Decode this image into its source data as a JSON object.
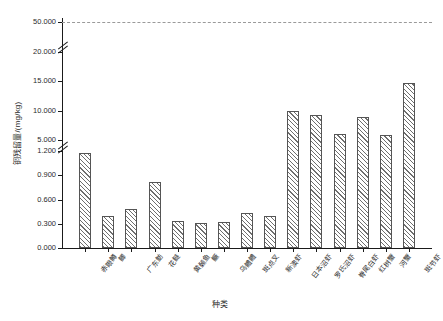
{
  "chart_data": {
    "type": "bar",
    "title": "",
    "xlabel": "种类",
    "ylabel": "铜残留量/(mg/kg)",
    "grid": false,
    "legend": null,
    "axis_breaks": [
      1.2,
      20.0
    ],
    "y_ticks": [
      "0.000",
      "0.300",
      "0.600",
      "0.900",
      "1.200",
      "5.000",
      "10.000",
      "15.000",
      "20.000",
      "50.000"
    ],
    "y_tick_values": [
      0.0,
      0.3,
      0.6,
      0.9,
      1.2,
      5.0,
      10.0,
      15.0,
      20.0,
      50.0
    ],
    "ylim": [
      0,
      50
    ],
    "reference_line": {
      "value": 50.0,
      "label": "50.000",
      "style": "dashed"
    },
    "categories": [
      "赤眼鳟",
      "鲫",
      "广东鲂",
      "花鲢",
      "黄颡鱼",
      "鳜",
      "乌鳢鳢",
      "斑点叉",
      "新澳虾",
      "日本沼虾",
      "罗氏沼虾",
      "脊尾白虾",
      "红树蟹",
      "河蟹",
      "斑节虾"
    ],
    "values": [
      1.17,
      0.4,
      0.48,
      0.82,
      0.33,
      0.31,
      0.32,
      0.43,
      0.39,
      10.0,
      9.2,
      6.0,
      9.0,
      5.9,
      14.7
    ],
    "value_labels": [
      "1.17",
      "0.40",
      "0.48",
      "0.82",
      "0.33",
      "0.31",
      "0.32",
      "0.43",
      "0.39",
      "10.00",
      "9.20",
      "6.00",
      "9.00",
      "5.90",
      "14.70"
    ]
  },
  "style": {
    "bar_edge": "#555555",
    "bar_hatch": "#6e6e6e",
    "bar_fill": "#ffffff",
    "axis_color": "#1a1a1a",
    "limit_line_color": "#9a9a9a",
    "text_color": "#2b2b2b"
  }
}
